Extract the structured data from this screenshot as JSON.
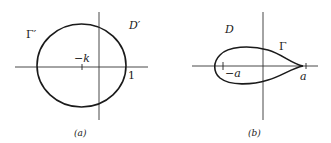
{
  "figure_a": {
    "curve_label": "Γ′",
    "domain_label": "D′",
    "tick_label": "−k",
    "point_label": "1",
    "caption": "(a)"
  },
  "figure_b": {
    "curve_label": "Γ",
    "domain_label": "D",
    "left_tick_label": "−a",
    "right_point_label": "a",
    "caption": "(b)"
  },
  "colors": {
    "stroke": "#1a1a1a",
    "background": "#ffffff"
  }
}
